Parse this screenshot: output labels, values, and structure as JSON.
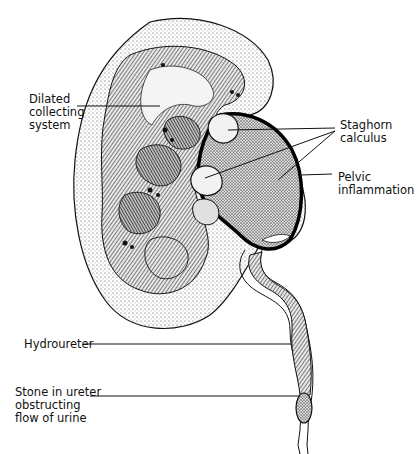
{
  "diagram": {
    "labels": {
      "dilated_collecting_system": "Dilated\ncollecting\nsystem",
      "staghorn_calculus": "Staghorn\ncalculus",
      "pelvic_inflammation": "Pelvic\ninflammation",
      "hydroureter": "Hydroureter",
      "stone_in_ureter": "Stone in ureter\nobstructing\nflow of urine"
    },
    "colors": {
      "ink": "#111111",
      "background": "#ffffff",
      "cortex_stipple": "#555555"
    }
  }
}
